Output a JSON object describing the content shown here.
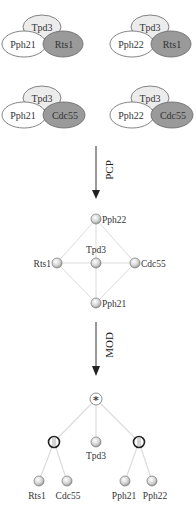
{
  "complexes": [
    {
      "top": "Tpd3",
      "left": "Pph21",
      "right": "Rts1"
    },
    {
      "top": "Tpd3",
      "left": "Pph22",
      "right": "Rts1"
    },
    {
      "top": "Tpd3",
      "left": "Pph21",
      "right": "Cdc55"
    },
    {
      "top": "Tpd3",
      "left": "Pph22",
      "right": "Cdc55"
    }
  ],
  "arrows": {
    "first": "PCP",
    "second": "MOD"
  },
  "network": {
    "nodes": {
      "top": "Pph22",
      "left": "Rts1",
      "center": "Tpd3",
      "right": "Cdc55",
      "bottom": "Pph21"
    }
  },
  "tree": {
    "root_symbol": "*",
    "root_type": "series",
    "left_group_type": "parallel",
    "right_group_type": "parallel",
    "middle_leaf": "Tpd3",
    "left_leaves": [
      "Rts1",
      "Cdc55"
    ],
    "right_leaves": [
      "Pph21",
      "Pph22"
    ]
  },
  "colors": {
    "white_fill": "#ffffff",
    "light_fill": "#e8e8e8",
    "dark_fill": "#9a9a9a",
    "outline": "#666666",
    "edge": "#d8d8d8"
  }
}
